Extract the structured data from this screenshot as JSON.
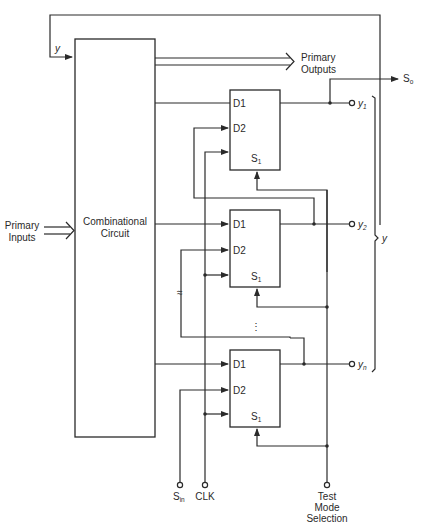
{
  "diagram": {
    "combinational_block": {
      "line1": "Combinational",
      "line2": "Circuit"
    },
    "primary_inputs": {
      "line1": "Primary",
      "line2": "Inputs"
    },
    "primary_outputs": {
      "line1": "Primary",
      "line2": "Outputs"
    },
    "feedback_label": "y",
    "flip_flops": [
      {
        "d1": "D1",
        "d2": "D2",
        "sel": "S",
        "sel_sub": "1",
        "output": "y",
        "output_sub": "1"
      },
      {
        "d1": "D1",
        "d2": "D2",
        "sel": "S",
        "sel_sub": "1",
        "output": "y",
        "output_sub": "2"
      },
      {
        "d1": "D1",
        "d2": "D2",
        "sel": "S",
        "sel_sub": "1",
        "output": "y",
        "output_sub": "n"
      }
    ],
    "scan_out": {
      "label": "S",
      "sub": "o"
    },
    "bracket_label": "y",
    "ellipsis": "⋮",
    "bottom_terminals": {
      "scan_in": {
        "label": "S",
        "sub": "in"
      },
      "clock": "CLK",
      "test_mode": {
        "line1": "Test",
        "line2": "Mode",
        "line3": "Selection"
      }
    }
  }
}
